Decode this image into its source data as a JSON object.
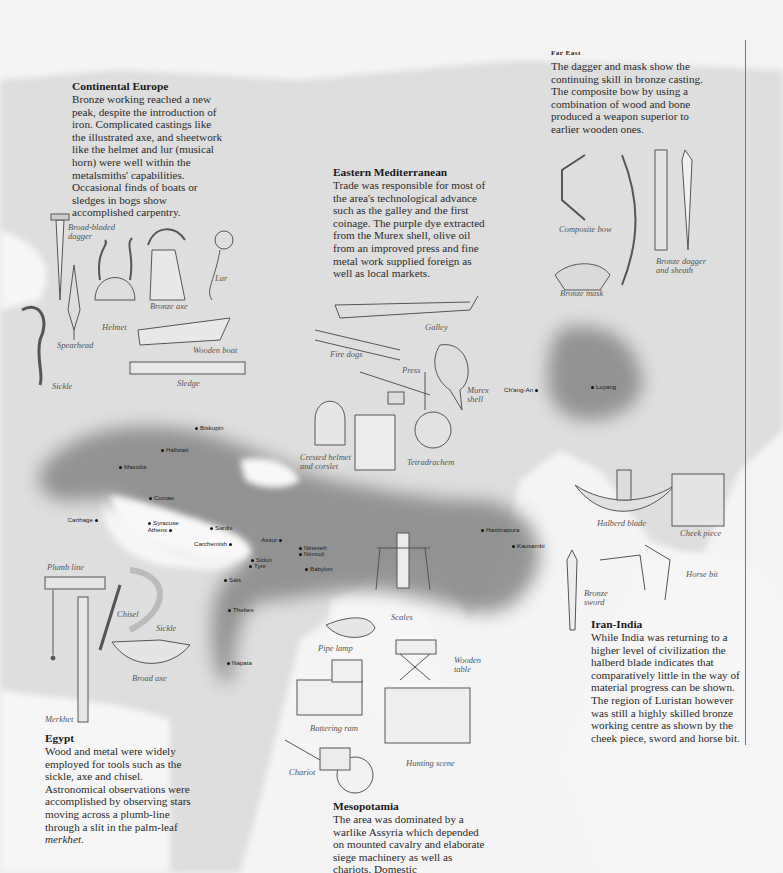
{
  "panels": {
    "continental_europe": {
      "title": "Continental Europe",
      "body": "Bronze working reached a new peak, despite the introduction of iron. Complicated castings like the illustrated axe, and sheetwork like the helmet and lur (musical horn) were well within the metalsmiths' capabilities. Occasional finds of boats or sledges in bogs show accomplished carpentry."
    },
    "far_east": {
      "title": "Far East",
      "body": "The dagger and mask show the continuing skill in bronze casting. The composite bow by using a combination of wood and bone produced a weapon superior to earlier wooden ones."
    },
    "eastern_mediterranean": {
      "title": "Eastern Mediterranean",
      "body": "Trade was responsible for most of the area's technological advance such as the galley and the first coinage. The purple dye extracted from the Murex shell, olive oil from an improved press and fine metal work supplied foreign as well as local markets."
    },
    "iran_india": {
      "title": "Iran-India",
      "body": "While India was returning to a higher level of civilization the halberd blade indicates that comparatively little in the way of material progress can be shown. The region of Luristan however was still a highly skilled bronze working centre as shown by the cheek piece, sword and horse bit."
    },
    "egypt": {
      "title": "Egypt",
      "body_before": "Wood and metal were widely employed for tools such as the sickle, axe and chisel. Astronomical observations were accomplished by observing stars moving across a plumb-line through a slit in the palm-leaf ",
      "body_em": "merkhet",
      "body_after": "."
    },
    "mesopotamia": {
      "title": "Mesopotamia",
      "body": "The area was dominated by a warlike Assyria which depended on mounted cavalry and elaborate siege machinery as well as chariots. Domestic"
    }
  },
  "artifact_labels": {
    "broad_bladed_dagger": "Broad-bladed dagger",
    "bronze_axe": "Bronze axe",
    "lur": "Lur",
    "helmet": "Helmet",
    "spearhead": "Spearhead",
    "sickle_europe": "Sickle",
    "wooden_boat": "Wooden boat",
    "sledge": "Sledge",
    "galley": "Galley",
    "fire_dogs": "Fire dogs",
    "press": "Press",
    "murex_shell": "Murex shell",
    "crested_helmet": "Crested helmet and corslet",
    "tetradrachem": "Tetradrachem",
    "composite_bow": "Composite bow",
    "bronze_mask": "Bronze mask",
    "bronze_dagger": "Bronze dagger and sheath",
    "halberd_blade": "Halberd blade",
    "cheek_piece": "Cheek piece",
    "horse_bit": "Horse bit",
    "bronze_sword": "Bronze sword",
    "plumb_line": "Plumb line",
    "chisel": "Chisel",
    "sickle_egypt": "Sickle",
    "broad_axe": "Broad axe",
    "merkhet": "Merkhet",
    "scales": "Scales",
    "pipe_lamp": "Pipe lamp",
    "wooden_table": "Wooden table",
    "battering_ram": "Battering ram",
    "hunting_scene": "Hunting scene",
    "chariot": "Chariot"
  },
  "cities": [
    {
      "name": "Biskupin",
      "x": 197,
      "y": 427
    },
    {
      "name": "Hallstatt",
      "x": 163,
      "y": 449
    },
    {
      "name": "Massilia",
      "x": 121,
      "y": 466
    },
    {
      "name": "Cumae",
      "x": 151,
      "y": 497
    },
    {
      "name": "Carthage",
      "x": 96,
      "y": 519,
      "right": true
    },
    {
      "name": "Syracuse",
      "x": 150,
      "y": 522
    },
    {
      "name": "Athens",
      "x": 170,
      "y": 529,
      "right": true
    },
    {
      "name": "Sardis",
      "x": 212,
      "y": 527
    },
    {
      "name": "Carchemish",
      "x": 230,
      "y": 543,
      "right": true
    },
    {
      "name": "Assur",
      "x": 280,
      "y": 539,
      "right": true
    },
    {
      "name": "Nineveh",
      "x": 301,
      "y": 547
    },
    {
      "name": "Nimrud",
      "x": 301,
      "y": 553
    },
    {
      "name": "Sidon",
      "x": 253,
      "y": 559
    },
    {
      "name": "Tyre",
      "x": 251,
      "y": 565
    },
    {
      "name": "Babylon",
      "x": 307,
      "y": 568
    },
    {
      "name": "Sais",
      "x": 226,
      "y": 579
    },
    {
      "name": "Thebes",
      "x": 230,
      "y": 609
    },
    {
      "name": "Napata",
      "x": 229,
      "y": 662
    },
    {
      "name": "Hastinapura",
      "x": 483,
      "y": 529
    },
    {
      "name": "Kausambi",
      "x": 514,
      "y": 545
    },
    {
      "name": "Ch'ang-An",
      "x": 536,
      "y": 389,
      "right": true
    },
    {
      "name": "Loyang",
      "x": 593,
      "y": 386
    }
  ],
  "colors": {
    "land": "#d9d9d9",
    "civilization_zone": "#8c8c8c",
    "sea": "#f4f4f4"
  }
}
